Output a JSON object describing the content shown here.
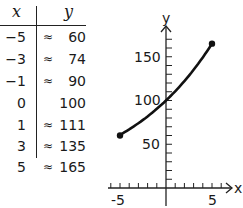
{
  "table": {
    "headers": {
      "x": "x",
      "y": "y"
    },
    "rows": [
      {
        "x": "−5",
        "approx": "≈",
        "y": "60"
      },
      {
        "x": "−3",
        "approx": "≈",
        "y": "74"
      },
      {
        "x": "−1",
        "approx": "≈",
        "y": "90"
      },
      {
        "x": "0",
        "approx": "",
        "y": "100"
      },
      {
        "x": "1",
        "approx": "≈",
        "y": "111"
      },
      {
        "x": "3",
        "approx": "≈",
        "y": "135"
      },
      {
        "x": "5",
        "approx": "≈",
        "y": "165"
      }
    ]
  },
  "graph": {
    "x_axis_label": "x",
    "y_axis_label": "y",
    "x_tick_labels": [
      "-5",
      "5"
    ],
    "y_tick_labels": [
      "50",
      "100",
      "150"
    ]
  },
  "chart_data": {
    "type": "line",
    "x": [
      -5,
      -3,
      -1,
      0,
      1,
      3,
      5
    ],
    "values": [
      60,
      74,
      90,
      100,
      111,
      135,
      165
    ],
    "xlabel": "x",
    "ylabel": "y",
    "xlim": [
      -6,
      6
    ],
    "ylim": [
      0,
      180
    ],
    "x_ticks_every": 1,
    "y_ticks_every": 10,
    "endpoints_marked": true
  }
}
